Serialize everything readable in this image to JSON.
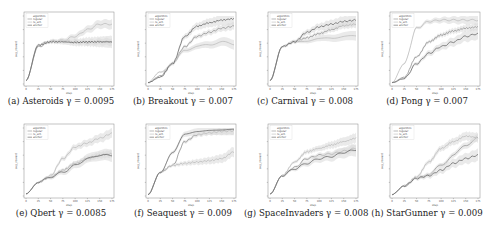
{
  "figure": {
    "legend_title": "algorithm",
    "legend_entries": [
      "regular",
      "rs_sch",
      "anchor"
    ],
    "x_label": "step",
    "y_label": "avg_reward",
    "x_ticks": [
      "0",
      "25",
      "50",
      "75",
      "100",
      "125",
      "150",
      "175"
    ],
    "colors": {
      "regular": "#8a8a8a",
      "rs_sch": "#b8b8b8",
      "anchor": "#5a5a5a",
      "band": "#d9d9d9"
    }
  },
  "panels": [
    {
      "label": "(a)",
      "game": "Asteroids",
      "gamma": "0.0095",
      "caption": "(a) Asteroids γ = 0.0095"
    },
    {
      "label": "(b)",
      "game": "Breakout",
      "gamma": "0.007",
      "caption": "(b) Breakout γ = 0.007"
    },
    {
      "label": "(c)",
      "game": "Carnival",
      "gamma": "0.008",
      "caption": "(c) Carnival γ = 0.008"
    },
    {
      "label": "(d)",
      "game": "Pong",
      "gamma": "0.007",
      "caption": "(d) Pong γ = 0.007"
    },
    {
      "label": "(e)",
      "game": "Qbert",
      "gamma": "0.0085",
      "caption": "(e) Qbert γ = 0.0085"
    },
    {
      "label": "(f)",
      "game": "Seaquest",
      "gamma": "0.009",
      "caption": "(f) Seaquest γ = 0.009"
    },
    {
      "label": "(g)",
      "game": "SpaceInvaders",
      "gamma": "0.008",
      "caption": "(g) SpaceInvaders γ = 0.008"
    },
    {
      "label": "(h)",
      "game": "StarGunner",
      "gamma": "0.009",
      "caption": "(h) StarGunner γ = 0.009"
    }
  ],
  "chart_data": [
    {
      "type": "line",
      "title": "(a) Asteroids γ = 0.0095",
      "xlabel": "step",
      "ylabel": "avg_reward",
      "x": [
        0,
        25,
        50,
        75,
        100,
        125,
        150,
        175
      ],
      "series": [
        {
          "name": "regular",
          "values": [
            0.05,
            0.55,
            0.62,
            0.63,
            0.62,
            0.61,
            0.62,
            0.62
          ]
        },
        {
          "name": "rs_sch",
          "values": [
            0.05,
            0.58,
            0.63,
            0.64,
            0.7,
            0.8,
            0.88,
            0.88
          ]
        },
        {
          "name": "anchor",
          "values": [
            0.05,
            0.57,
            0.62,
            0.62,
            0.61,
            0.62,
            0.62,
            0.62
          ]
        }
      ]
    },
    {
      "type": "line",
      "title": "(b) Breakout γ = 0.007",
      "xlabel": "step",
      "ylabel": "avg_reward",
      "x": [
        0,
        25,
        50,
        75,
        100,
        125,
        150,
        175
      ],
      "series": [
        {
          "name": "regular",
          "values": [
            0.02,
            0.12,
            0.3,
            0.55,
            0.7,
            0.76,
            0.82,
            0.85
          ]
        },
        {
          "name": "rs_sch",
          "values": [
            0.02,
            0.18,
            0.3,
            0.5,
            0.55,
            0.58,
            0.62,
            0.58
          ]
        },
        {
          "name": "anchor",
          "values": [
            0.02,
            0.1,
            0.3,
            0.7,
            0.85,
            0.9,
            0.94,
            0.96
          ]
        }
      ]
    },
    {
      "type": "line",
      "title": "(c) Carnival γ = 0.008",
      "xlabel": "step",
      "ylabel": "avg_reward",
      "x": [
        0,
        25,
        50,
        75,
        100,
        125,
        150,
        175
      ],
      "series": [
        {
          "name": "regular",
          "values": [
            0.05,
            0.55,
            0.62,
            0.68,
            0.74,
            0.8,
            0.86,
            0.88
          ]
        },
        {
          "name": "rs_sch",
          "values": [
            0.05,
            0.55,
            0.62,
            0.64,
            0.66,
            0.68,
            0.7,
            0.7
          ]
        },
        {
          "name": "anchor",
          "values": [
            0.05,
            0.55,
            0.62,
            0.76,
            0.84,
            0.88,
            0.92,
            0.94
          ]
        }
      ]
    },
    {
      "type": "line",
      "title": "(d) Pong γ = 0.007",
      "xlabel": "step",
      "ylabel": "avg_reward",
      "x": [
        0,
        25,
        50,
        75,
        100,
        125,
        150,
        175
      ],
      "series": [
        {
          "name": "regular",
          "values": [
            0.02,
            0.1,
            0.4,
            0.62,
            0.72,
            0.78,
            0.82,
            0.84
          ]
        },
        {
          "name": "rs_sch",
          "values": [
            0.02,
            0.3,
            0.82,
            0.92,
            0.94,
            0.94,
            0.94,
            0.94
          ]
        },
        {
          "name": "anchor",
          "values": [
            0.02,
            0.08,
            0.3,
            0.45,
            0.55,
            0.62,
            0.7,
            0.74
          ]
        }
      ]
    },
    {
      "type": "line",
      "title": "(e) Qbert γ = 0.0085",
      "xlabel": "step",
      "ylabel": "avg_reward",
      "x": [
        0,
        25,
        50,
        75,
        100,
        125,
        150,
        175
      ],
      "series": [
        {
          "name": "regular",
          "values": [
            0.03,
            0.2,
            0.28,
            0.38,
            0.48,
            0.55,
            0.6,
            0.62
          ]
        },
        {
          "name": "rs_sch",
          "values": [
            0.03,
            0.2,
            0.3,
            0.55,
            0.72,
            0.78,
            0.85,
            0.92
          ]
        },
        {
          "name": "anchor",
          "values": [
            0.03,
            0.2,
            0.28,
            0.35,
            0.45,
            0.55,
            0.6,
            0.6
          ]
        }
      ]
    },
    {
      "type": "line",
      "title": "(f) Seaquest γ = 0.009",
      "xlabel": "step",
      "ylabel": "avg_reward",
      "x": [
        0,
        25,
        50,
        75,
        100,
        125,
        150,
        175
      ],
      "series": [
        {
          "name": "regular",
          "values": [
            0.02,
            0.35,
            0.45,
            0.8,
            0.9,
            0.93,
            0.95,
            0.96
          ]
        },
        {
          "name": "rs_sch",
          "values": [
            0.02,
            0.35,
            0.45,
            0.48,
            0.5,
            0.52,
            0.55,
            0.65
          ]
        },
        {
          "name": "anchor",
          "values": [
            0.02,
            0.35,
            0.65,
            0.92,
            0.95,
            0.96,
            0.96,
            0.97
          ]
        }
      ]
    },
    {
      "type": "line",
      "title": "(g) SpaceInvaders γ = 0.008",
      "xlabel": "step",
      "ylabel": "avg_reward",
      "x": [
        0,
        25,
        50,
        75,
        100,
        125,
        150,
        175
      ],
      "series": [
        {
          "name": "regular",
          "values": [
            0.03,
            0.3,
            0.42,
            0.55,
            0.6,
            0.62,
            0.66,
            0.7
          ]
        },
        {
          "name": "rs_sch",
          "values": [
            0.03,
            0.3,
            0.5,
            0.65,
            0.7,
            0.75,
            0.8,
            0.85
          ]
        },
        {
          "name": "anchor",
          "values": [
            0.03,
            0.3,
            0.4,
            0.48,
            0.55,
            0.58,
            0.64,
            0.68
          ]
        }
      ]
    },
    {
      "type": "line",
      "title": "(h) StarGunner γ = 0.009",
      "xlabel": "step",
      "ylabel": "avg_reward",
      "x": [
        0,
        25,
        50,
        75,
        100,
        125,
        150,
        175
      ],
      "series": [
        {
          "name": "regular",
          "values": [
            0.02,
            0.15,
            0.26,
            0.32,
            0.45,
            0.6,
            0.75,
            0.85
          ]
        },
        {
          "name": "rs_sch",
          "values": [
            0.02,
            0.15,
            0.28,
            0.5,
            0.7,
            0.8,
            0.88,
            0.86
          ]
        },
        {
          "name": "anchor",
          "values": [
            0.02,
            0.15,
            0.26,
            0.3,
            0.38,
            0.48,
            0.55,
            0.6
          ]
        }
      ]
    }
  ]
}
